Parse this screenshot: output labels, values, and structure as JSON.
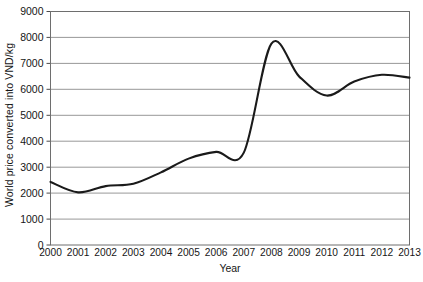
{
  "chart_data": {
    "type": "line",
    "title": "",
    "xlabel": "Year",
    "ylabel": "World price converted into VND/kg",
    "x": [
      2000,
      2001,
      2002,
      2003,
      2004,
      2005,
      2006,
      2007,
      2008,
      2009,
      2010,
      2011,
      2012,
      2013
    ],
    "xticklabels": [
      "2000",
      "2001",
      "2002",
      "2003",
      "2004",
      "2005",
      "2006",
      "2007",
      "2008",
      "2009",
      "2010",
      "2011",
      "2012",
      "2013"
    ],
    "values": [
      2430,
      2030,
      2270,
      2360,
      2800,
      3330,
      3590,
      3560,
      7760,
      6500,
      5760,
      6300,
      6560,
      6450
    ],
    "yticks": [
      0,
      1000,
      2000,
      3000,
      4000,
      5000,
      6000,
      7000,
      8000,
      9000
    ],
    "yticklabels": [
      "0",
      "1000",
      "2000",
      "3000",
      "4000",
      "5000",
      "6000",
      "7000",
      "8000",
      "9000"
    ],
    "ylim": [
      0,
      9000
    ],
    "xlim": [
      2000,
      2013
    ],
    "grid": true,
    "grid_orientation": "horizontal",
    "legend": "none",
    "line_color": "#1a1a1a",
    "grid_color": "#8c8c8c",
    "border_color": "#6e6e6e",
    "background": "#ffffff",
    "series_name": "World price"
  },
  "axis": {
    "ylabel_text": "World price converted into VND/kg",
    "xlabel_text": "Year"
  }
}
